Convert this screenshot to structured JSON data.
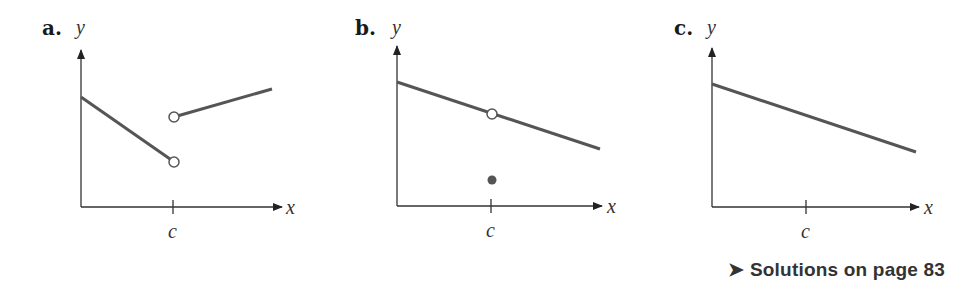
{
  "panels": [
    {
      "label": "a.",
      "y_label": "y",
      "x_label": "x",
      "tick_label": "c",
      "description": "Jump discontinuity at c: left segment decreasing to an open circle; right segment begins at a higher open circle and increases."
    },
    {
      "label": "b.",
      "y_label": "y",
      "x_label": "x",
      "tick_label": "c",
      "description": "Removable discontinuity at c: decreasing line with an open circle at c, filled point below the line at c."
    },
    {
      "label": "c.",
      "y_label": "y",
      "x_label": "x",
      "tick_label": "c",
      "description": "Continuous decreasing line through c."
    }
  ],
  "footer": {
    "arrow": "➤",
    "text": "Solutions on page 83"
  },
  "colors": {
    "line": "#555555",
    "axis": "#333333",
    "point_fill": "#555555"
  }
}
